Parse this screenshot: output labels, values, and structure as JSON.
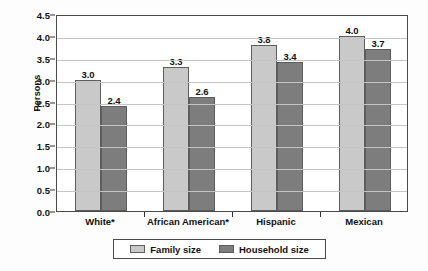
{
  "chart_data": {
    "type": "bar",
    "title": "",
    "xlabel": "",
    "ylabel": "Persons",
    "ylim": [
      0.0,
      4.5
    ],
    "ytick_step": 0.5,
    "grid": true,
    "legend_position": "bottom",
    "categories": [
      "White*",
      "African American*",
      "Hispanic",
      "Mexican"
    ],
    "series": [
      {
        "name": "Family size",
        "color": "#c9c9c9",
        "values": [
          3.0,
          3.3,
          3.8,
          4.0
        ],
        "labels": [
          "3.0",
          "3.3",
          "3.8",
          "4.0"
        ]
      },
      {
        "name": "Household size",
        "color": "#7d7d7d",
        "values": [
          2.4,
          2.6,
          3.4,
          3.7
        ],
        "labels": [
          "2.4",
          "2.6",
          "3.4",
          "3.7"
        ]
      }
    ],
    "ytick_labels": [
      "0.0",
      "0.5",
      "1.0",
      "1.5",
      "2.0",
      "2.5",
      "3.0",
      "3.5",
      "4.0",
      "4.5"
    ],
    "ytick_values": [
      0.0,
      0.5,
      1.0,
      1.5,
      2.0,
      2.5,
      3.0,
      3.5,
      4.0,
      4.5
    ]
  },
  "legend": {
    "items": [
      {
        "label": "Family size"
      },
      {
        "label": "Household size"
      }
    ]
  }
}
